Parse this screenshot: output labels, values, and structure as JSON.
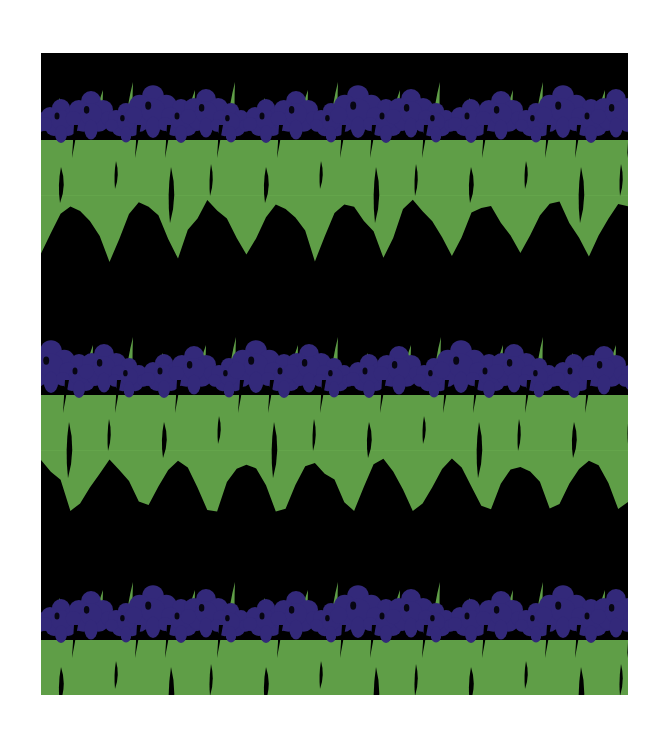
{
  "image": {
    "subject": "Iris flower textile pattern",
    "description": "Repeating horizontal bands of purple iris blossoms over green leaf bands on a black ground",
    "frame": {
      "x": 41,
      "y": 53,
      "width": 587,
      "height": 642
    },
    "colors": {
      "background": "#000000",
      "page": "#ffffff",
      "flower": "#33297a",
      "flower_dark": "#241d5e",
      "leaf": "#5f9e47",
      "leaf_light": "#6aab50"
    },
    "repeat": {
      "horizontal_px": 205,
      "vertical_px": 500
    },
    "bands": [
      {
        "name": "top-band",
        "flower_y": 100,
        "leaf_top": 140,
        "leaf_bottom": 275,
        "offset_x": 0
      },
      {
        "name": "middle-band",
        "flower_y": 355,
        "leaf_top": 395,
        "leaf_bottom": 535,
        "offset_x": -102
      },
      {
        "name": "bottom-band",
        "flower_y": 600,
        "leaf_top": 640,
        "leaf_bottom": 775,
        "offset_x": 0
      }
    ]
  }
}
